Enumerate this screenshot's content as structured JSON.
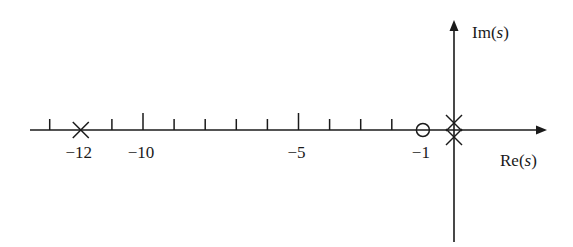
{
  "diagram": {
    "type": "pole-zero-plot",
    "axes": {
      "real_axis_label": "Re(s)",
      "imag_axis_label": "Im(s)",
      "real_label_prefix": "Re(",
      "imag_label_prefix": "Im(",
      "var": "s",
      "close_paren": ")"
    },
    "tick_labels": [
      {
        "value": -12,
        "text": "−12"
      },
      {
        "value": -10,
        "text": "−10"
      },
      {
        "value": -5,
        "text": "−5"
      },
      {
        "value": -1,
        "text": "−1"
      }
    ],
    "ticks": [
      -13,
      -11,
      -10,
      -9,
      -8,
      -7,
      -6,
      -5,
      -4,
      -3,
      -2
    ],
    "major_ticks": [
      -10,
      -5
    ],
    "poles": [
      {
        "re": -12,
        "im": 0,
        "marker": "x"
      },
      {
        "re": 0,
        "im": 0.2,
        "marker": "x"
      },
      {
        "re": 0,
        "im": -0.2,
        "marker": "x"
      }
    ],
    "zeros": [
      {
        "re": -1,
        "im": 0,
        "marker": "o"
      }
    ],
    "colors": {
      "stroke": "#1a1a1a",
      "background": "#ffffff"
    }
  }
}
